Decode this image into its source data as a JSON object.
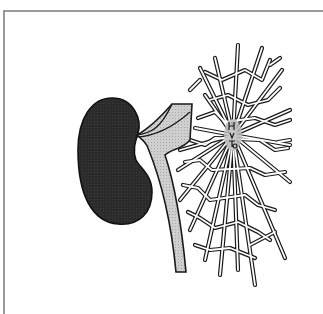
{
  "illustration": {
    "subject": "kidney with ureter and branching crystal network",
    "colors": {
      "background": "#ffffff",
      "frame": "#9a9a9a",
      "kidney_fill": "#2a2a2a",
      "ureter_fill": "#c8c8c8",
      "outline": "#1a1a1a",
      "network_fill": "#ffffff",
      "center_fill": "#bdbdbd"
    },
    "center_marks": "H V T6"
  }
}
